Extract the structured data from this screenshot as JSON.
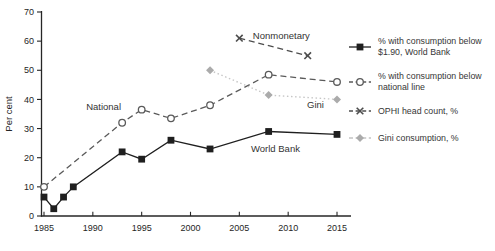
{
  "figure": {
    "ylabel": "Per cent"
  },
  "chart_data": {
    "type": "line",
    "title": "",
    "xlabel": "",
    "ylabel": "Per cent",
    "ylim": [
      0,
      70
    ],
    "xlim": [
      1984.7,
      2016.4
    ],
    "yticks": [
      0,
      10,
      20,
      30,
      40,
      50,
      60,
      70
    ],
    "xticks": [
      1985,
      1990,
      1995,
      2000,
      2005,
      2010,
      2015
    ],
    "grid": false,
    "legend_position": "right",
    "series": [
      {
        "id": "wb-190",
        "name": "% with consumption below $1.90, World Bank",
        "marker": "filled-square",
        "line_style": "solid",
        "color": "#1f1f1f",
        "x": [
          1985,
          1986,
          1987,
          1988,
          1993,
          1995,
          1998,
          2002,
          2008,
          2015
        ],
        "y": [
          6.5,
          2.5,
          6.5,
          10,
          22,
          19.5,
          26,
          23,
          29,
          28
        ]
      },
      {
        "id": "national-line",
        "name": "% with consumption below national line",
        "marker": "open-circle",
        "line_style": "dashed",
        "color": "#5a5a5a",
        "x": [
          1985,
          1993,
          1995,
          1998,
          2002,
          2008,
          2015
        ],
        "y": [
          10,
          32,
          36.5,
          33.5,
          38,
          48.5,
          46
        ]
      },
      {
        "id": "ophi",
        "name": "OPHI head count, %",
        "marker": "x-cross",
        "line_style": "dashed",
        "color": "#4d4d4d",
        "x": [
          2005,
          2012
        ],
        "y": [
          61,
          55
        ]
      },
      {
        "id": "gini",
        "name": "Gini consumption, %",
        "marker": "diamond",
        "line_style": "dotted",
        "color": "#c6c6c6",
        "marker_color": "#ababab",
        "x": [
          2002,
          2008,
          2015
        ],
        "y": [
          50,
          41.5,
          40
        ]
      }
    ],
    "annotations": [
      {
        "id": "national",
        "text": "National",
        "x": 1991.1,
        "y": 37.3
      },
      {
        "id": "nonmonetary",
        "text": "Nonmonetary",
        "x": 2009.3,
        "y": 62
      },
      {
        "id": "gini",
        "text": "Gini",
        "x": 2012.8,
        "y": 38.2
      },
      {
        "id": "world-bank",
        "text": "World Bank",
        "x": 2008.7,
        "y": 23.2
      }
    ]
  },
  "legend": {
    "entries": [
      {
        "id": "wb-190",
        "label": "% with consumption below $1.90, World Bank",
        "marker": "filled-square",
        "line_style": "solid",
        "color": "#1f1f1f"
      },
      {
        "id": "national-line",
        "label": "% with consumption below national line",
        "marker": "open-circle",
        "line_style": "dashed",
        "color": "#5a5a5a"
      },
      {
        "id": "ophi",
        "label": "OPHI head count, %",
        "marker": "x-cross",
        "line_style": "dashed",
        "color": "#4d4d4d"
      },
      {
        "id": "gini",
        "label": "Gini consumption, %",
        "marker": "diamond",
        "line_style": "dashed",
        "color": "#c3c3c3",
        "marker_color": "#ababab"
      }
    ]
  }
}
